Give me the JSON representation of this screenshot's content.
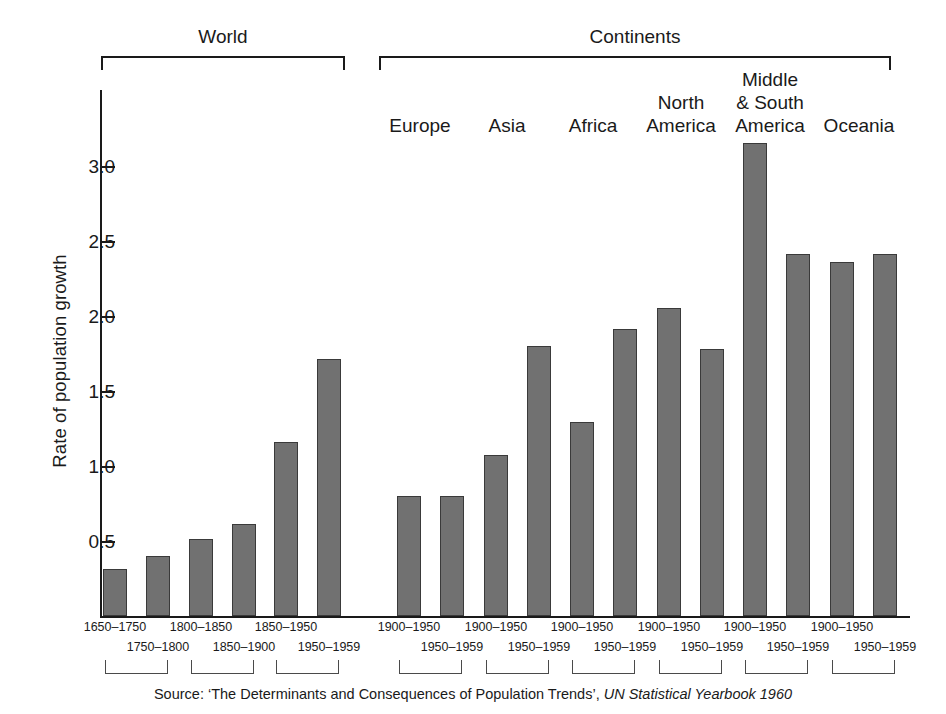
{
  "chart_data": {
    "type": "bar",
    "title": "",
    "xlabel": "",
    "ylabel": "Rate of population growth",
    "ylim": [
      0,
      3.5
    ],
    "yticks": [
      "0.5",
      "1.0",
      "1.5",
      "2.0",
      "2.5",
      "3.0"
    ],
    "ytick_values": [
      0.5,
      1.0,
      1.5,
      2.0,
      2.5,
      3.0
    ],
    "grid": false,
    "legend": "none",
    "groups": [
      {
        "name": "World",
        "categories": [
          "1650–1750",
          "1750–1800",
          "1800–1850",
          "1850–1900",
          "1850–1950",
          "1950–1959"
        ],
        "values": [
          0.31,
          0.4,
          0.51,
          0.61,
          1.16,
          1.71
        ]
      },
      {
        "name": "Continents",
        "subgroups": [
          {
            "name": "Europe",
            "categories": [
              "1900–1950",
              "1950–1959"
            ],
            "values": [
              0.8,
              0.8
            ]
          },
          {
            "name": "Asia",
            "categories": [
              "1900–1950",
              "1950–1959"
            ],
            "values": [
              1.07,
              1.8
            ]
          },
          {
            "name": "Africa",
            "categories": [
              "1900–1950",
              "1950–1959"
            ],
            "values": [
              1.29,
              1.91
            ]
          },
          {
            "name": "North\nAmerica",
            "categories": [
              "1900–1950",
              "1950–1959"
            ],
            "values": [
              2.05,
              1.78
            ]
          },
          {
            "name": "Middle\n& South\nAmerica",
            "categories": [
              "1900–1950",
              "1950–1959"
            ],
            "values": [
              3.15,
              2.41
            ]
          },
          {
            "name": "Oceania",
            "categories": [
              "1900–1950",
              "1950–1959"
            ],
            "values": [
              2.36,
              2.41
            ]
          }
        ]
      }
    ],
    "bar_color": "#717171",
    "bar_edge_color": "#3a3a3a",
    "axis_color": "#1a1a1a"
  },
  "axis": {
    "y_title": "Rate of population growth",
    "ticks": [
      {
        "label": "3.0"
      },
      {
        "label": "2.5"
      },
      {
        "label": "2.0"
      },
      {
        "label": "1.5"
      },
      {
        "label": "1.0"
      },
      {
        "label": "0.5"
      }
    ]
  },
  "top_groups": [
    {
      "label": "World"
    },
    {
      "label": "Continents"
    }
  ],
  "continents": [
    {
      "label": "Europe"
    },
    {
      "label": "Asia"
    },
    {
      "label": "Africa"
    },
    {
      "label": "North\nAmerica"
    },
    {
      "label": "Middle\n& South\nAmerica"
    },
    {
      "label": "Oceania"
    }
  ],
  "period_labels": {
    "world": [
      "1650–1750",
      "1750–1800",
      "1800–1850",
      "1850–1900",
      "1850–1950",
      "1950–1959"
    ],
    "continents": [
      "1900–1950",
      "1950–1959",
      "1900–1950",
      "1950–1959",
      "1900–1950",
      "1950–1959",
      "1900–1950",
      "1950–1959",
      "1900–1950",
      "1950–1959",
      "1900–1950",
      "1950–1959"
    ]
  },
  "source": {
    "prefix": "Source:  ‘The Determinants and Consequences of Population Trends’, ",
    "italic": "UN Statistical Yearbook 1960"
  }
}
